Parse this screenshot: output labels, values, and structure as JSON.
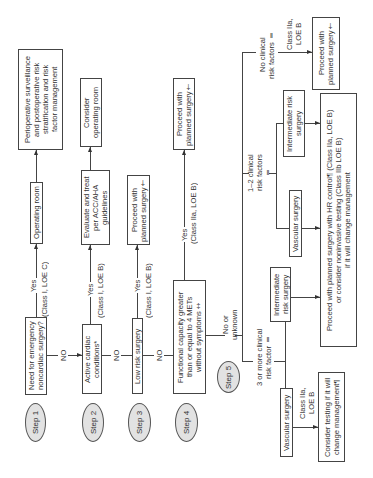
{
  "steps": [
    "Step 1",
    "Step 2",
    "Step 3",
    "Step 4",
    "Step 5"
  ],
  "step1": {
    "question": "Need for emergency\nnoncardiac surgery?",
    "yes": "Yes",
    "evidence": "(Class I, LOE C)",
    "no": "NO",
    "outcome": "Operating room",
    "next": "Perioperative surveillance\nand postoperative risk\nstratification and risk\nfactor management"
  },
  "step2": {
    "question": "Active cardiac\nconditions*",
    "yes": "Yes",
    "evidence": "(Class I, LOE B)",
    "no": "NO",
    "outcome": "Evaluate and treat\nper ACC/AHA\nguidelines",
    "next": "Consider\noperating room"
  },
  "step3": {
    "question": "Low risk surgery",
    "yes": "Yes",
    "evidence": "(Class I, LOE B)",
    "no": "NO",
    "outcome": "Proceed with\nplanned surgery†"
  },
  "step4": {
    "question": "Functional capacity greater\nthan or equal to 4 METs\nwithout symptoms‡",
    "yes": "Yes",
    "evidence": "(Class IIa, LOE B)",
    "no": "No or unknown",
    "outcome": "Proceed with\nplanned surgery†"
  },
  "step5": {
    "no_risk": {
      "label": "No clinical\nrisk factors ‖",
      "evidence": "Class IIa,\nLOE B",
      "outcome": "Proceed with\nplanned surgery†"
    },
    "one_two_risk": {
      "label": "1–2 clinical\nrisk factors ‖",
      "intermediate": "Intermediate risk\nsurgery",
      "vascular": "Vascular surgery"
    },
    "three_plus_risk": {
      "label": "3 or more clinical\nrisk factor ‖",
      "intermediate": "Intermediate\nrisk surgery",
      "vascular": "Vascular surgery",
      "evidence": "Class IIa,\nLOE B",
      "outcome": "Consider testing if it will\nchange management¶"
    },
    "shared_outcome": "Proceed with planned surgery with HR control¶ (Class IIa, LOE B)\nor consider noninvasive testing (Class IIb LOE B)\nif it will change management"
  }
}
